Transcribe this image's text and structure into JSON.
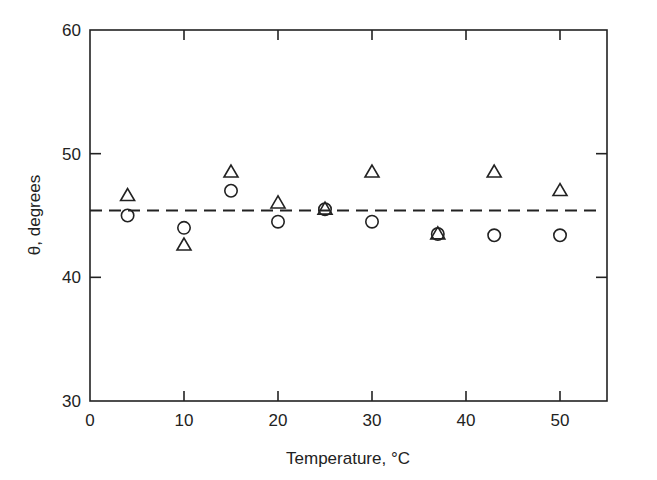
{
  "chart_data": {
    "type": "scatter",
    "title": "",
    "xlabel": "Temperature, °C",
    "ylabel": "θ, degrees",
    "xlim": [
      0,
      55
    ],
    "ylim": [
      30,
      60
    ],
    "x_ticks": [
      0,
      10,
      20,
      30,
      40,
      50
    ],
    "y_ticks": [
      30,
      40,
      50,
      60
    ],
    "grid": false,
    "legend": null,
    "series": [
      {
        "name": "triangles",
        "marker": "triangle-open",
        "points": [
          {
            "x": 4,
            "y": 46.6
          },
          {
            "x": 10,
            "y": 42.6
          },
          {
            "x": 15,
            "y": 48.5
          },
          {
            "x": 20,
            "y": 46.0
          },
          {
            "x": 25,
            "y": 45.5
          },
          {
            "x": 30,
            "y": 48.5
          },
          {
            "x": 37,
            "y": 43.5
          },
          {
            "x": 43,
            "y": 48.5
          },
          {
            "x": 50,
            "y": 47.0
          }
        ]
      },
      {
        "name": "circles",
        "marker": "circle-open",
        "points": [
          {
            "x": 4,
            "y": 45.0
          },
          {
            "x": 10,
            "y": 44.0
          },
          {
            "x": 15,
            "y": 47.0
          },
          {
            "x": 20,
            "y": 44.5
          },
          {
            "x": 25,
            "y": 45.5
          },
          {
            "x": 30,
            "y": 44.5
          },
          {
            "x": 37,
            "y": 43.5
          },
          {
            "x": 43,
            "y": 43.4
          },
          {
            "x": 50,
            "y": 43.4
          }
        ]
      }
    ],
    "reference_lines": [
      {
        "type": "horizontal",
        "style": "dashed",
        "y": 45.4
      }
    ]
  },
  "axes": {
    "x_tick_labels": [
      "0",
      "10",
      "20",
      "30",
      "40",
      "50"
    ],
    "y_tick_labels": [
      "30",
      "40",
      "50",
      "60"
    ],
    "x_title": "Temperature, °C",
    "y_title": "θ, degrees"
  }
}
